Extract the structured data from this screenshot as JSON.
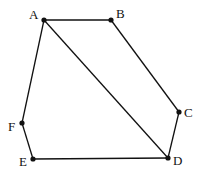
{
  "diagram": {
    "type": "polygon",
    "background": "#ffffff",
    "stroke_color": "#111111",
    "points": [
      {
        "id": "A",
        "label": "A",
        "x": 44,
        "y": 20,
        "lx": 29,
        "ly": 19
      },
      {
        "id": "B",
        "label": "B",
        "x": 111,
        "y": 20,
        "lx": 116,
        "ly": 18
      },
      {
        "id": "C",
        "label": "C",
        "x": 179,
        "y": 112,
        "lx": 184,
        "ly": 117
      },
      {
        "id": "D",
        "label": "D",
        "x": 168,
        "y": 158,
        "lx": 173,
        "ly": 165
      },
      {
        "id": "E",
        "label": "E",
        "x": 33,
        "y": 159,
        "lx": 19,
        "ly": 166
      },
      {
        "id": "F",
        "label": "F",
        "x": 22,
        "y": 123,
        "lx": 8,
        "ly": 131
      }
    ],
    "edges": [
      [
        "A",
        "B"
      ],
      [
        "B",
        "C"
      ],
      [
        "C",
        "D"
      ],
      [
        "D",
        "E"
      ],
      [
        "E",
        "F"
      ],
      [
        "F",
        "A"
      ],
      [
        "A",
        "D"
      ]
    ]
  }
}
